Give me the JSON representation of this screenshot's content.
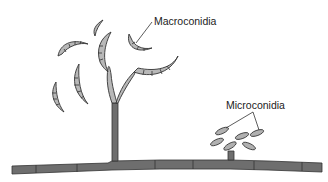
{
  "diagram": {
    "labels": {
      "macroconidia": "Macroconidia",
      "microconidia": "Microconidia"
    },
    "colors": {
      "hypha_fill": "#6e6e6e",
      "conidium_fill": "#b8b8b8",
      "outline": "#333333",
      "background": "#ffffff"
    },
    "structures": [
      {
        "name": "main-hypha",
        "type": "septate horizontal hypha"
      },
      {
        "name": "macroconidiophore",
        "type": "upright branched conidiophore"
      },
      {
        "name": "macroconidia",
        "type": "sickle-shaped septate spores",
        "count": 7
      },
      {
        "name": "microconidiophore",
        "type": "short lateral stalk"
      },
      {
        "name": "microconidia",
        "type": "small oval spores",
        "count": 6
      }
    ]
  }
}
